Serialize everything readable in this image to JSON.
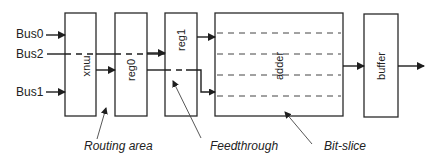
{
  "diagram": {
    "inputs": [
      {
        "label": "Bus0"
      },
      {
        "label": "Bus2"
      },
      {
        "label": "Bus1"
      }
    ],
    "blocks": [
      {
        "label": "mux"
      },
      {
        "label": "reg0"
      },
      {
        "label": "reg1"
      },
      {
        "label": "adder"
      },
      {
        "label": "buffer"
      }
    ],
    "annotations": [
      {
        "label": "Routing area"
      },
      {
        "label": "Feedthrough"
      },
      {
        "label": "Bit-slice"
      }
    ]
  }
}
